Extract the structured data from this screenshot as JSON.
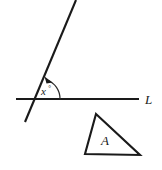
{
  "figure": {
    "background_color": "#ffffff",
    "stroke_color": "#1a1a1a",
    "width": 162,
    "height": 170
  },
  "line_L": {
    "name": "horizontal-line",
    "label": "L",
    "label_x": 145,
    "label_y": 103,
    "x1": 16,
    "y1": 99,
    "x2": 139,
    "y2": 99
  },
  "transversal": {
    "name": "slanted-line",
    "x1": 76,
    "y1": 0,
    "x2": 25,
    "y2": 122
  },
  "angle": {
    "name": "angle-x",
    "label_variable": "x",
    "label_degree": "°",
    "label_x": 41,
    "label_y": 95,
    "vertex_x": 40,
    "vertex_y": 99,
    "arc_radius": 20,
    "arc_start_x": 47,
    "arc_start_y": 80,
    "arc_end_x": 60,
    "arc_end_y": 99,
    "arrow_at": "arc-start"
  },
  "triangle": {
    "name": "triangle-A",
    "label": "A",
    "label_x": 101,
    "label_y": 145,
    "apex_x": 96,
    "apex_y": 114,
    "bottom_left_x": 85,
    "bottom_left_y": 154,
    "bottom_right_x": 140,
    "bottom_right_y": 155
  }
}
